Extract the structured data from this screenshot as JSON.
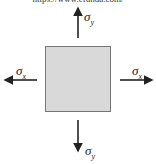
{
  "header": {
    "url_text": "https://www.efunda.com/"
  },
  "diagram": {
    "element": "stress-element-square",
    "fill_color": "#d9d9d9",
    "labels": {
      "top": {
        "symbol": "σ",
        "subscript": "y"
      },
      "bottom": {
        "symbol": "σ",
        "subscript": "y"
      },
      "left": {
        "symbol": "σ",
        "subscript": "x"
      },
      "right": {
        "symbol": "σ",
        "subscript": "x"
      }
    }
  }
}
